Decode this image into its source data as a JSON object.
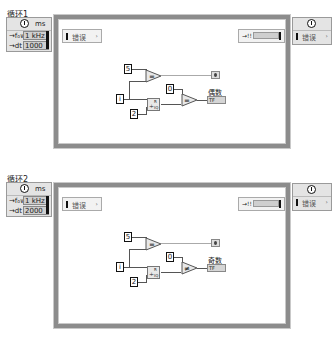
{
  "loops": [
    {
      "label": "循环1",
      "timing": {
        "unit": "ms",
        "rows": [
          {
            "label": "→f₀w",
            "value": "1 kHz"
          },
          {
            "label": "→dt",
            "value": "1000"
          }
        ]
      },
      "left_terminal": {
        "text": "错误",
        "arrow": "›"
      },
      "right_terminal": {
        "text": "→!!"
      },
      "diagram": {
        "constants": [
          "5",
          "i",
          "2",
          "0"
        ],
        "compare_top": "=",
        "quotient_node": {
          "symbol": "÷",
          "labels": [
            "R",
            "IQ"
          ]
        },
        "compare_bottom": "=",
        "indicator_label": "偶数",
        "indicator_value": "TF"
      },
      "right_node": {
        "text": "错误",
        "arrow": "›"
      }
    },
    {
      "label": "循环2",
      "timing": {
        "unit": "ms",
        "rows": [
          {
            "label": "→f₀w",
            "value": "1 kHz"
          },
          {
            "label": "→dt",
            "value": "2000"
          }
        ]
      },
      "left_terminal": {
        "text": "错误",
        "arrow": "›"
      },
      "right_terminal": {
        "text": "→!!"
      },
      "diagram": {
        "constants": [
          "5",
          "i",
          "2",
          "0"
        ],
        "compare_top": "=",
        "quotient_node": {
          "symbol": "÷",
          "labels": [
            "R",
            "IQ"
          ]
        },
        "compare_bottom": "≠",
        "indicator_label": "奇数",
        "indicator_value": "TF"
      },
      "right_node": {
        "text": "错误",
        "arrow": "›"
      }
    }
  ]
}
